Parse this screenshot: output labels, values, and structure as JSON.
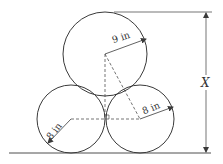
{
  "diagram": {
    "type": "geometry",
    "labels": {
      "top_radius": "9 in",
      "right_radius": "8 in",
      "left_radius": "8 in",
      "height": "X"
    },
    "circles": [
      {
        "name": "top",
        "radius_in": 9
      },
      {
        "name": "bottom-left",
        "radius_in": 8
      },
      {
        "name": "bottom-right",
        "radius_in": 8
      }
    ],
    "colors": {
      "stroke": "#3a3a3a",
      "background": "#ffffff"
    }
  }
}
